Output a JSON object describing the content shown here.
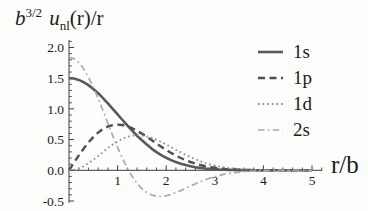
{
  "title": {
    "b": "b",
    "b_exp": "3/2",
    "u": "u",
    "u_sub": "nl",
    "rest": "(r)/r"
  },
  "chart_data": {
    "type": "line",
    "xlabel": "r/b",
    "ylabel": "",
    "xlim": [
      0,
      5.21
    ],
    "ylim": [
      -0.53,
      2.12
    ],
    "grid": false,
    "legend_position": "upper right",
    "axis_color": "#3c3c3c",
    "x_tick_positions": [
      1,
      2,
      3,
      4,
      5
    ],
    "x_tick_labels": [
      "1",
      "2",
      "3",
      "4",
      "5"
    ],
    "y_tick_positions": [
      -0.5,
      0,
      0.5,
      1,
      1.5,
      2
    ],
    "y_tick_labels": [
      "-0.5",
      "0.0",
      "0.5",
      "1.0",
      "1.5",
      "2.0"
    ],
    "x_minor_step": 0.2,
    "y_minor_step": 0.1,
    "x": [
      0,
      0.1,
      0.2,
      0.3,
      0.4,
      0.5,
      0.6,
      0.7,
      0.8,
      0.9,
      1,
      1.1,
      1.2,
      1.3,
      1.4,
      1.5,
      1.6,
      1.7,
      1.8,
      1.9,
      2,
      2.1,
      2.2,
      2.3,
      2.4,
      2.5,
      2.6,
      2.7,
      2.8,
      2.9,
      3,
      3.1,
      3.2,
      3.3,
      3.4,
      3.5,
      3.6,
      3.7,
      3.8,
      3.9,
      4,
      4.1,
      4.2,
      4.3,
      4.4,
      4.5,
      4.6,
      4.7,
      4.8,
      4.9,
      5
    ],
    "series": [
      {
        "name": "1s",
        "color": "#595959",
        "dash": "solid",
        "width": 2.6,
        "values": [
          1.502,
          1.495,
          1.473,
          1.436,
          1.387,
          1.326,
          1.255,
          1.176,
          1.091,
          1.002,
          0.911,
          0.82,
          0.731,
          0.645,
          0.564,
          0.488,
          0.418,
          0.354,
          0.297,
          0.247,
          0.203,
          0.166,
          0.134,
          0.107,
          0.084,
          0.066,
          0.051,
          0.039,
          0.03,
          0.022,
          0.017,
          0.012,
          0.009,
          0.006,
          0.005,
          0.003,
          0.002,
          0.002,
          0.001,
          0.001,
          0.001,
          0,
          0,
          0,
          0,
          0,
          0,
          0,
          0,
          0,
          0
        ]
      },
      {
        "name": "1p",
        "color": "#4f4f4f",
        "dash": "dashed",
        "width": 2.4,
        "values": [
          0,
          0.122,
          0.24,
          0.352,
          0.453,
          0.541,
          0.615,
          0.672,
          0.713,
          0.736,
          0.744,
          0.737,
          0.716,
          0.685,
          0.644,
          0.597,
          0.546,
          0.492,
          0.437,
          0.383,
          0.332,
          0.284,
          0.24,
          0.2,
          0.165,
          0.135,
          0.109,
          0.087,
          0.068,
          0.053,
          0.041,
          0.031,
          0.023,
          0.017,
          0.013,
          0.009,
          0.007,
          0.005,
          0.003,
          0.002,
          0.002,
          0.001,
          0.001,
          0.001,
          0,
          0,
          0,
          0,
          0,
          0,
          0
        ]
      },
      {
        "name": "1d",
        "color": "#8e8e8e",
        "dash": "dotted",
        "width": 1.8,
        "values": [
          0,
          0.008,
          0.03,
          0.067,
          0.115,
          0.171,
          0.233,
          0.298,
          0.361,
          0.419,
          0.471,
          0.513,
          0.544,
          0.563,
          0.571,
          0.567,
          0.552,
          0.529,
          0.497,
          0.461,
          0.42,
          0.377,
          0.334,
          0.291,
          0.251,
          0.213,
          0.179,
          0.148,
          0.121,
          0.097,
          0.078,
          0.061,
          0.047,
          0.036,
          0.028,
          0.021,
          0.015,
          0.011,
          0.008,
          0.006,
          0.004,
          0.003,
          0.002,
          0.001,
          0.001,
          0.001,
          0,
          0,
          0,
          0,
          0
        ]
      },
      {
        "name": "2s",
        "color": "#a9a9a9",
        "dash": "dashdot",
        "width": 1.7,
        "values": [
          1.84,
          1.819,
          1.756,
          1.653,
          1.517,
          1.353,
          1.168,
          0.97,
          0.766,
          0.564,
          0.372,
          0.194,
          0.036,
          -0.1,
          -0.212,
          -0.299,
          -0.362,
          -0.402,
          -0.422,
          -0.426,
          -0.415,
          -0.394,
          -0.364,
          -0.33,
          -0.293,
          -0.256,
          -0.22,
          -0.186,
          -0.154,
          -0.126,
          -0.102,
          -0.081,
          -0.064,
          -0.05,
          -0.038,
          -0.029,
          -0.022,
          -0.016,
          -0.012,
          -0.008,
          -0.006,
          -0.004,
          -0.003,
          -0.002,
          -0.002,
          -0.001,
          -0.001,
          -0.001,
          0,
          0,
          0
        ]
      }
    ]
  }
}
